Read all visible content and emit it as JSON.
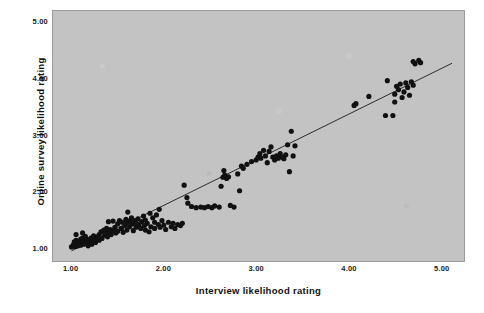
{
  "chart_data": {
    "type": "scatter",
    "title": "",
    "xlabel": "Interview likelihood rating",
    "ylabel": "Online survey likelihood rating",
    "xlim": [
      0.8,
      5.25
    ],
    "ylim": [
      0.75,
      5.2
    ],
    "xticks": [
      "1.00",
      "2.00",
      "3.00",
      "4.00",
      "5.00"
    ],
    "xtick_values": [
      1,
      2,
      3,
      4,
      5
    ],
    "yticks": [
      "1.00",
      "2.00",
      "3.00",
      "4.00",
      "5.00"
    ],
    "ytick_values": [
      1,
      2,
      3,
      4,
      5
    ],
    "grid": false,
    "legend": null,
    "background_color": "#c3c3c3",
    "point_color": "#111111",
    "line_color": "#1a1a1a",
    "fit_line": {
      "label": "linear fit line",
      "x_start": 1.0,
      "y_start": 0.93,
      "x_end": 5.12,
      "y_end": 4.27
    },
    "points": [
      [
        1.0,
        1.0
      ],
      [
        1.02,
        1.04
      ],
      [
        1.03,
        1.09
      ],
      [
        1.04,
        1.01
      ],
      [
        1.05,
        1.12
      ],
      [
        1.06,
        1.05
      ],
      [
        1.07,
        1.02
      ],
      [
        1.08,
        1.1
      ],
      [
        1.09,
        1.06
      ],
      [
        1.1,
        1.14
      ],
      [
        1.1,
        1.03
      ],
      [
        1.11,
        1.08
      ],
      [
        1.12,
        1.16
      ],
      [
        1.13,
        1.05
      ],
      [
        1.14,
        1.11
      ],
      [
        1.15,
        1.19
      ],
      [
        1.16,
        1.07
      ],
      [
        1.17,
        1.13
      ],
      [
        1.18,
        1.02
      ],
      [
        1.19,
        1.09
      ],
      [
        1.05,
        1.22
      ],
      [
        1.12,
        1.25
      ],
      [
        1.2,
        1.1
      ],
      [
        1.21,
        1.16
      ],
      [
        1.22,
        1.05
      ],
      [
        1.24,
        1.2
      ],
      [
        1.25,
        1.12
      ],
      [
        1.26,
        1.08
      ],
      [
        1.28,
        1.18
      ],
      [
        1.3,
        1.22
      ],
      [
        1.3,
        1.12
      ],
      [
        1.32,
        1.27
      ],
      [
        1.33,
        1.15
      ],
      [
        1.35,
        1.3
      ],
      [
        1.36,
        1.21
      ],
      [
        1.37,
        1.24
      ],
      [
        1.38,
        1.33
      ],
      [
        1.39,
        1.18
      ],
      [
        1.4,
        1.26
      ],
      [
        1.4,
        1.45
      ],
      [
        1.42,
        1.31
      ],
      [
        1.43,
        1.22
      ],
      [
        1.45,
        1.46
      ],
      [
        1.45,
        1.29
      ],
      [
        1.47,
        1.35
      ],
      [
        1.48,
        1.25
      ],
      [
        1.5,
        1.41
      ],
      [
        1.5,
        1.28
      ],
      [
        1.52,
        1.47
      ],
      [
        1.54,
        1.33
      ],
      [
        1.55,
        1.44
      ],
      [
        1.56,
        1.26
      ],
      [
        1.58,
        1.38
      ],
      [
        1.59,
        1.49
      ],
      [
        1.6,
        1.43
      ],
      [
        1.6,
        1.3
      ],
      [
        1.61,
        1.62
      ],
      [
        1.62,
        1.46
      ],
      [
        1.63,
        1.36
      ],
      [
        1.64,
        1.44
      ],
      [
        1.65,
        1.52
      ],
      [
        1.66,
        1.41
      ],
      [
        1.67,
        1.29
      ],
      [
        1.68,
        1.47
      ],
      [
        1.7,
        1.43
      ],
      [
        1.7,
        1.35
      ],
      [
        1.72,
        1.5
      ],
      [
        1.73,
        1.4
      ],
      [
        1.75,
        1.33
      ],
      [
        1.76,
        1.45
      ],
      [
        1.78,
        1.55
      ],
      [
        1.79,
        1.38
      ],
      [
        1.8,
        1.48
      ],
      [
        1.8,
        1.3
      ],
      [
        1.82,
        1.42
      ],
      [
        1.84,
        1.27
      ],
      [
        1.85,
        1.6
      ],
      [
        1.86,
        1.36
      ],
      [
        1.88,
        1.52
      ],
      [
        1.9,
        1.44
      ],
      [
        1.9,
        1.33
      ],
      [
        1.92,
        1.57
      ],
      [
        1.94,
        1.4
      ],
      [
        1.95,
        1.67
      ],
      [
        1.96,
        1.35
      ],
      [
        1.98,
        1.47
      ],
      [
        2.0,
        1.39
      ],
      [
        2.02,
        1.31
      ],
      [
        2.05,
        1.44
      ],
      [
        2.08,
        1.36
      ],
      [
        2.1,
        1.42
      ],
      [
        2.12,
        1.33
      ],
      [
        2.15,
        1.4
      ],
      [
        2.18,
        1.38
      ],
      [
        2.2,
        1.42
      ],
      [
        2.22,
        2.1
      ],
      [
        2.25,
        1.88
      ],
      [
        2.26,
        1.78
      ],
      [
        2.3,
        1.72
      ],
      [
        2.35,
        1.7
      ],
      [
        2.4,
        1.71
      ],
      [
        2.44,
        1.7
      ],
      [
        2.48,
        1.72
      ],
      [
        2.52,
        1.7
      ],
      [
        2.55,
        1.73
      ],
      [
        2.6,
        1.71
      ],
      [
        2.62,
        2.08
      ],
      [
        2.64,
        2.24
      ],
      [
        2.65,
        2.36
      ],
      [
        2.66,
        2.28
      ],
      [
        2.68,
        2.22
      ],
      [
        2.7,
        2.25
      ],
      [
        2.72,
        1.74
      ],
      [
        2.76,
        1.71
      ],
      [
        2.8,
        2.3
      ],
      [
        2.82,
        2.0
      ],
      [
        2.84,
        2.44
      ],
      [
        2.86,
        2.4
      ],
      [
        2.9,
        2.47
      ],
      [
        2.95,
        2.52
      ],
      [
        3.0,
        2.55
      ],
      [
        3.02,
        2.6
      ],
      [
        3.04,
        2.66
      ],
      [
        3.05,
        2.58
      ],
      [
        3.08,
        2.72
      ],
      [
        3.1,
        2.62
      ],
      [
        3.12,
        2.5
      ],
      [
        3.14,
        2.7
      ],
      [
        3.16,
        2.78
      ],
      [
        3.18,
        2.6
      ],
      [
        3.2,
        2.55
      ],
      [
        3.22,
        2.62
      ],
      [
        3.24,
        2.58
      ],
      [
        3.26,
        2.66
      ],
      [
        3.28,
        2.6
      ],
      [
        3.3,
        2.57
      ],
      [
        3.32,
        2.64
      ],
      [
        3.34,
        2.82
      ],
      [
        3.36,
        2.34
      ],
      [
        3.38,
        3.06
      ],
      [
        3.4,
        2.62
      ],
      [
        3.42,
        2.8
      ],
      [
        4.06,
        3.52
      ],
      [
        4.08,
        3.55
      ],
      [
        4.22,
        3.68
      ],
      [
        4.4,
        3.34
      ],
      [
        4.42,
        3.96
      ],
      [
        4.48,
        3.34
      ],
      [
        4.5,
        3.72
      ],
      [
        4.5,
        3.58
      ],
      [
        4.52,
        3.86
      ],
      [
        4.54,
        3.8
      ],
      [
        4.56,
        3.9
      ],
      [
        4.58,
        3.66
      ],
      [
        4.6,
        3.76
      ],
      [
        4.62,
        3.92
      ],
      [
        4.64,
        3.84
      ],
      [
        4.66,
        3.7
      ],
      [
        4.68,
        3.94
      ],
      [
        4.7,
        3.88
      ],
      [
        4.7,
        4.3
      ],
      [
        4.72,
        4.26
      ],
      [
        4.76,
        4.32
      ],
      [
        4.78,
        4.28
      ]
    ]
  }
}
